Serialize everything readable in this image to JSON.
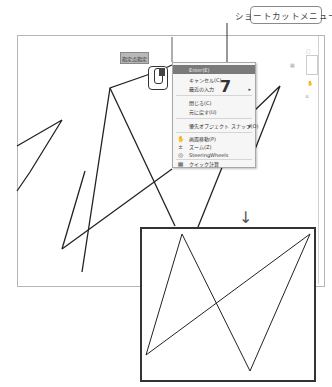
{
  "callout": {
    "label": "ショートカットメニュー"
  },
  "canvas": {
    "coordinate_tooltip": "指定点指定"
  },
  "context_menu": {
    "items": [
      {
        "label": "Enter(E)",
        "highlighted": true,
        "has_submenu": false,
        "icon": ""
      },
      {
        "label": "キャンセル(C)",
        "highlighted": false,
        "has_submenu": false,
        "icon": ""
      },
      {
        "label": "最近の入力",
        "highlighted": false,
        "has_submenu": true,
        "icon": ""
      },
      {
        "label": "閉じる(C)",
        "highlighted": false,
        "has_submenu": false,
        "icon": ""
      },
      {
        "label": "元に戻す(U)",
        "highlighted": false,
        "has_submenu": false,
        "icon": ""
      },
      {
        "label": "優先オブジェクト スナップ(O)",
        "highlighted": false,
        "has_submenu": true,
        "icon": ""
      },
      {
        "label": "画面移動(P)",
        "highlighted": false,
        "has_submenu": false,
        "icon": "pan-icon"
      },
      {
        "label": "ズーム(Z)",
        "highlighted": false,
        "has_submenu": false,
        "icon": "zoom-icon"
      },
      {
        "label": "SteeringWheels",
        "highlighted": false,
        "has_submenu": false,
        "icon": "steeringwheel-icon"
      },
      {
        "label": "クイック計算",
        "highlighted": false,
        "has_submenu": false,
        "icon": "calculator-icon"
      }
    ],
    "submenu_arrow": "▸"
  },
  "annotation": {
    "step_number": "7",
    "down_arrow": "↓"
  },
  "colors": {
    "highlight": "#7a7a7a",
    "line": "#222222",
    "frame": "#b5b5b5"
  }
}
